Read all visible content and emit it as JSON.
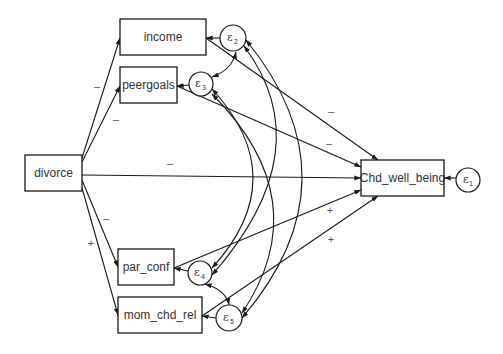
{
  "diagram": {
    "type": "path-diagram",
    "observed_variables": [
      {
        "id": "divorce",
        "label": "divorce"
      },
      {
        "id": "income",
        "label": "income"
      },
      {
        "id": "peergoals",
        "label": "peergoals"
      },
      {
        "id": "par_conf",
        "label": "par_conf"
      },
      {
        "id": "mom_chd_rel",
        "label": "mom_chd_rel"
      },
      {
        "id": "chd_well_being",
        "label": "Chd_well_being"
      }
    ],
    "error_terms": [
      {
        "id": "e1",
        "symbol": "ε",
        "sub": "1",
        "target": "Chd_well_being"
      },
      {
        "id": "e2",
        "symbol": "ε",
        "sub": "2",
        "target": "income"
      },
      {
        "id": "e3",
        "symbol": "ε",
        "sub": "3",
        "target": "peergoals"
      },
      {
        "id": "e4",
        "symbol": "ε",
        "sub": "4",
        "target": "par_conf"
      },
      {
        "id": "e5",
        "symbol": "ε",
        "sub": "5",
        "target": "mom_chd_rel"
      }
    ],
    "paths": [
      {
        "from": "divorce",
        "to": "income",
        "sign": "–"
      },
      {
        "from": "divorce",
        "to": "peergoals",
        "sign": "–"
      },
      {
        "from": "divorce",
        "to": "Chd_well_being",
        "sign": "–"
      },
      {
        "from": "divorce",
        "to": "par_conf",
        "sign": "–"
      },
      {
        "from": "divorce",
        "to": "mom_chd_rel",
        "sign": "+"
      },
      {
        "from": "income",
        "to": "Chd_well_being",
        "sign": "–"
      },
      {
        "from": "peergoals",
        "to": "Chd_well_being",
        "sign": "–"
      },
      {
        "from": "par_conf",
        "to": "Chd_well_being",
        "sign": "+"
      },
      {
        "from": "mom_chd_rel",
        "to": "Chd_well_being",
        "sign": "+"
      }
    ],
    "covariances": [
      [
        "e2",
        "e3"
      ],
      [
        "e2",
        "e4"
      ],
      [
        "e2",
        "e5"
      ],
      [
        "e3",
        "e4"
      ],
      [
        "e3",
        "e5"
      ],
      [
        "e4",
        "e5"
      ]
    ],
    "signs": {
      "div_income": "–",
      "div_peergoals": "–",
      "div_chd": "–",
      "div_parconf": "–",
      "div_momchd": "+",
      "income_chd": "–",
      "peergoals_chd": "–",
      "parconf_chd": "+",
      "momchd_chd": "+"
    }
  }
}
